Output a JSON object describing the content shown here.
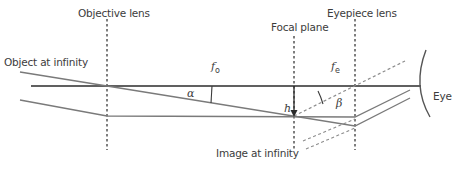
{
  "diagram": {
    "labels": {
      "objective_lens": "Objective lens",
      "focal_plane": "Focal plane",
      "eyepiece_lens": "Eyepiece lens",
      "object_at_infinity": "Object at infinity",
      "image_at_infinity": "Image at infinity",
      "eye": "Eye"
    },
    "symbols": {
      "fo_main": "f",
      "fo_sub": "o",
      "fe_main": "f",
      "fe_sub": "e",
      "alpha": "α",
      "beta": "β",
      "h": "h"
    },
    "colors": {
      "axis": "#2b2b2b",
      "ray": "#7a7a7a",
      "dashed": "#8c8c8c",
      "lens": "#3a3a3a",
      "text": "#3c3c3c"
    }
  }
}
